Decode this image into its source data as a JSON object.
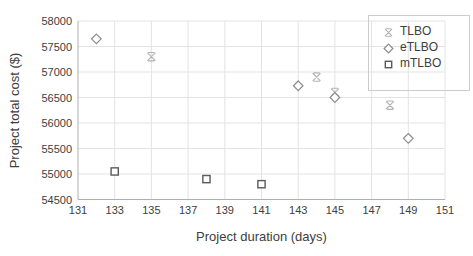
{
  "chart_data": {
    "type": "scatter",
    "title": "",
    "xlabel": "Project duration (days)",
    "ylabel": "Project total cost ($)",
    "xlim": [
      131,
      151
    ],
    "ylim": [
      54500,
      58000
    ],
    "x_ticks": [
      131,
      133,
      135,
      137,
      139,
      141,
      143,
      145,
      147,
      149,
      151
    ],
    "y_ticks": [
      54500,
      55000,
      55500,
      56000,
      56500,
      57000,
      57500,
      58000
    ],
    "grid": true,
    "legend_position": "top-right",
    "colors": {
      "gridline": "#e3e3e3",
      "axis_line": "#b0b0b0",
      "tick_label": "#404040",
      "legend_border": "#cccccc"
    },
    "series": [
      {
        "name": "TLBO",
        "marker": "x",
        "color": "#b3b3b3",
        "points": [
          [
            135,
            57300
          ],
          [
            144,
            56900
          ],
          [
            145,
            56600
          ],
          [
            148,
            56350
          ]
        ]
      },
      {
        "name": "eTLBO",
        "marker": "diamond",
        "color": "#8c8c8c",
        "points": [
          [
            132,
            57650
          ],
          [
            143,
            56730
          ],
          [
            145,
            56500
          ],
          [
            149,
            55700
          ]
        ]
      },
      {
        "name": "mTLBO",
        "marker": "square",
        "color": "#5a5a5a",
        "points": [
          [
            133,
            55050
          ],
          [
            138,
            54900
          ],
          [
            141,
            54800
          ]
        ]
      }
    ]
  }
}
